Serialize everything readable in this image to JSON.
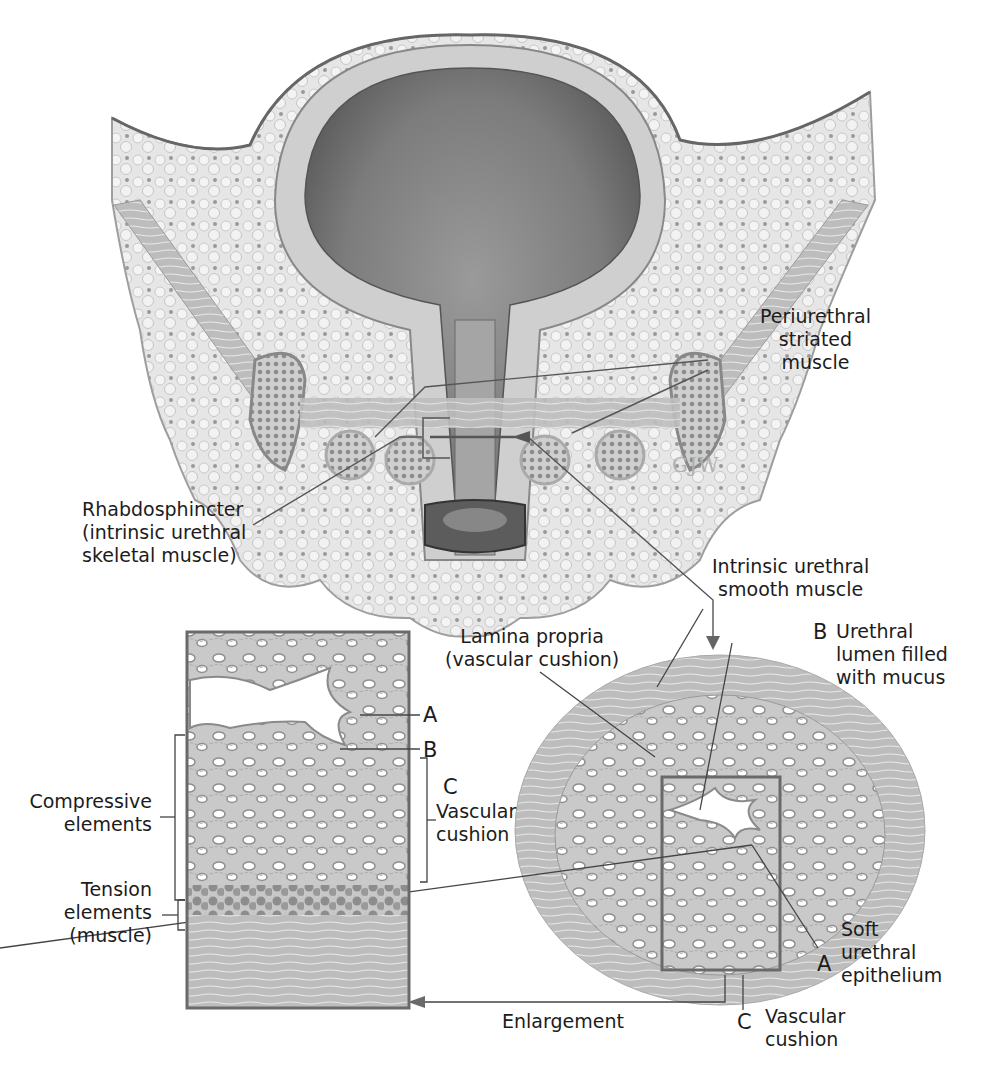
{
  "figure": {
    "signature": "GJW",
    "colors": {
      "ink": "#1c1c1c",
      "leader_line": "#555555",
      "tissue_light": "#e3e3e3",
      "tissue_mid": "#c4c4c4",
      "tissue_dark": "#8a8a8a",
      "bladder_lumen": "#7a7a7a",
      "frame": "#6a6a6a"
    }
  },
  "labels": {
    "periurethral": [
      "Periurethral",
      "striated",
      "muscle"
    ],
    "rhabdosphincter": [
      "Rhabdosphincter",
      "(intrinsic urethral",
      "skeletal muscle)"
    ],
    "intrinsic_smooth": [
      "Intrinsic urethral",
      "smooth muscle"
    ],
    "lamina_propria": [
      "Lamina propria",
      "(vascular cushion)"
    ],
    "urethral_lumen": {
      "letter": "B",
      "lines": [
        "Urethral",
        "lumen filled",
        "with mucus"
      ]
    },
    "soft_epithelium": {
      "letter": "A",
      "lines": [
        "Soft",
        "urethral",
        "epithelium"
      ]
    },
    "vascular_cushion_bottom": {
      "letter": "C",
      "lines": [
        "Vascular",
        "cushion"
      ]
    },
    "enlargement": "Enlargement",
    "compressive": [
      "Compressive",
      "elements"
    ],
    "tension": [
      "Tension",
      "elements",
      "(muscle)"
    ],
    "inset_a": "A",
    "inset_b": "B",
    "inset_c": {
      "letter": "C",
      "lines": [
        "Vascular",
        "cushion"
      ]
    }
  }
}
